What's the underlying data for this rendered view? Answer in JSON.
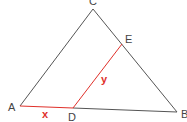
{
  "diagram": {
    "type": "triangle-geometry",
    "points": {
      "A": {
        "label": "A",
        "x": 20,
        "y": 106
      },
      "B": {
        "label": "B",
        "x": 177,
        "y": 112
      },
      "C": {
        "label": "C",
        "x": 93,
        "y": 9
      },
      "D": {
        "label": "D",
        "x": 73,
        "y": 108
      },
      "E": {
        "label": "E",
        "x": 122,
        "y": 44
      }
    },
    "segments": [
      {
        "from": "A",
        "to": "C",
        "color": "#555555"
      },
      {
        "from": "C",
        "to": "B",
        "color": "#555555"
      },
      {
        "from": "D",
        "to": "B",
        "color": "#555555"
      },
      {
        "from": "A",
        "to": "D",
        "color": "#e0302a",
        "label": "x"
      },
      {
        "from": "D",
        "to": "E",
        "color": "#e0302a",
        "label": "y"
      }
    ],
    "segment_labels": {
      "x": "x",
      "y": "y"
    },
    "colors": {
      "line": "#555555",
      "highlight": "#e0302a",
      "text": "#444444"
    }
  }
}
